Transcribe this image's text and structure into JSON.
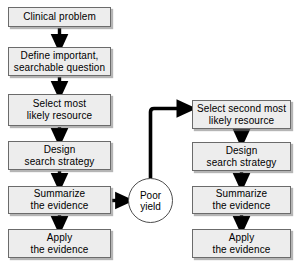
{
  "diagram": {
    "background_color": "#ffffff",
    "box_fill_color": "#ededed",
    "box_border_color": "#6b6b6b",
    "ellipse_fill_color": "#ffffff",
    "connector_color": "#000000"
  },
  "left_branch": {
    "nodes": [
      {
        "id": "clinical-problem",
        "lines": [
          "Clinical problem"
        ],
        "x": 8,
        "y": 7,
        "w": 103,
        "h": 20
      },
      {
        "id": "define-question",
        "lines": [
          "Define important,",
          "searchable question"
        ],
        "x": 8,
        "y": 47,
        "w": 103,
        "h": 29
      },
      {
        "id": "select-most-likely-resource",
        "lines": [
          "Select most",
          "likely resource"
        ],
        "x": 8,
        "y": 94,
        "w": 103,
        "h": 32
      },
      {
        "id": "design-search-strategy-left",
        "lines": [
          "Design",
          "search strategy"
        ],
        "x": 8,
        "y": 141,
        "w": 103,
        "h": 29
      },
      {
        "id": "summarize-evidence-left",
        "lines": [
          "Summarize",
          "the evidence"
        ],
        "x": 8,
        "y": 186,
        "w": 103,
        "h": 28
      },
      {
        "id": "apply-evidence-left",
        "lines": [
          "Apply",
          "the evidence"
        ],
        "x": 8,
        "y": 229,
        "w": 103,
        "h": 29
      }
    ]
  },
  "outcome": {
    "id": "poor-yield",
    "lines": [
      "Poor",
      "yield"
    ],
    "x": 128,
    "y": 178,
    "w": 45,
    "h": 45
  },
  "right_branch": {
    "nodes": [
      {
        "id": "select-second-most-likely-resource",
        "lines": [
          "Select second most",
          "likely resource"
        ],
        "x": 192,
        "y": 100,
        "w": 99,
        "h": 29
      },
      {
        "id": "design-search-strategy-right",
        "lines": [
          "Design",
          "search strategy"
        ],
        "x": 192,
        "y": 142,
        "w": 99,
        "h": 29
      },
      {
        "id": "summarize-evidence-right",
        "lines": [
          "Summarize",
          "the evidence"
        ],
        "x": 192,
        "y": 186,
        "w": 99,
        "h": 28
      },
      {
        "id": "apply-evidence-right",
        "lines": [
          "Apply",
          "the evidence"
        ],
        "x": 192,
        "y": 229,
        "w": 99,
        "h": 29
      }
    ]
  },
  "connectors": [
    {
      "id": "clinical-to-define",
      "type": "vertical-arrow"
    },
    {
      "id": "define-to-select",
      "type": "vertical-arrow"
    },
    {
      "id": "select-to-design",
      "type": "vertical-arrow"
    },
    {
      "id": "design-to-summarize",
      "type": "vertical-arrow"
    },
    {
      "id": "summarize-to-apply",
      "type": "vertical-arrow"
    },
    {
      "id": "summarize-to-poor-yield",
      "type": "horizontal-arrow"
    },
    {
      "id": "poor-yield-to-select-second",
      "type": "elbow-arrow"
    },
    {
      "id": "select-second-to-design-right",
      "type": "vertical-arrow"
    },
    {
      "id": "design-right-to-summarize-right",
      "type": "vertical-arrow"
    },
    {
      "id": "summarize-right-to-apply-right",
      "type": "vertical-arrow"
    }
  ]
}
